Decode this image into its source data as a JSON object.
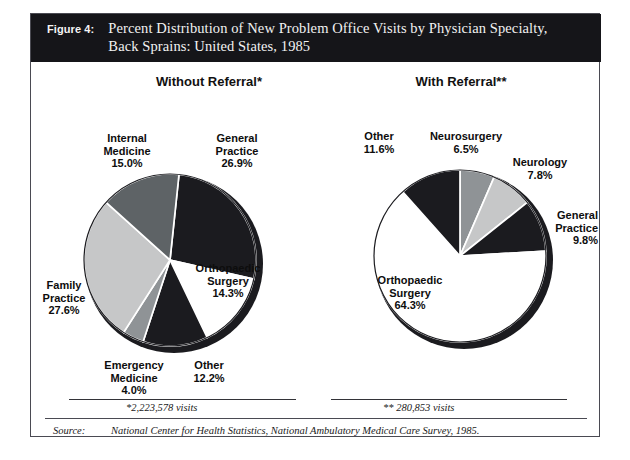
{
  "figure": {
    "label": "Figure 4:",
    "title_line_1": "Percent Distribution of New Problem Office Visits by Physician Specialty,",
    "title_line_2": "Back Sprains:  United States, 1985"
  },
  "panels": {
    "left_heading": "Without Referral*",
    "right_heading": "With Referral**"
  },
  "footnotes": {
    "left": "*2,223,578 visits",
    "right": "** 280,853 visits",
    "source_label": "Source:",
    "source_text": "National Center for Health Statistics, National Ambulatory Medical Care Survey, 1985."
  },
  "colors": {
    "header_bg": "#151519",
    "black_slice": "#1b1b1f",
    "dark_gray_slice": "#5e6366",
    "mid_gray_slice": "#8f9396",
    "light_gray_slice": "#c6c7c8",
    "white_slice": "#ffffff",
    "slice_outline": "#ffffff",
    "pie_edge": "#1b1b1f",
    "frame_border": "#4a4a52"
  },
  "chart_data": [
    {
      "type": "pie",
      "title": "Without Referral*",
      "total_label": "*2,223,578 visits",
      "total_visits": 2223578,
      "legend": "labels placed around slices",
      "categories": [
        "General Practice",
        "Orthopaedic Surgery",
        "Other",
        "Emergency Medicine",
        "Family Practice",
        "Internal Medicine"
      ],
      "values": [
        26.9,
        14.3,
        12.2,
        4.0,
        27.6,
        15.0
      ],
      "unit": "percent",
      "slices": [
        {
          "name": "General Practice",
          "percent": "26.9%",
          "value": 26.9,
          "fill": "#1b1b1f",
          "label_lines": [
            "General",
            "Practice",
            "26.9%"
          ]
        },
        {
          "name": "Orthopaedic Surgery",
          "percent": "14.3%",
          "value": 14.3,
          "fill": "#ffffff",
          "label_lines": [
            "Orthopaedic",
            "Surgery",
            "14.3%"
          ]
        },
        {
          "name": "Other",
          "percent": "12.2%",
          "value": 12.2,
          "fill": "#1b1b1f",
          "label_lines": [
            "Other",
            "12.2%"
          ]
        },
        {
          "name": "Emergency Medicine",
          "percent": "4.0%",
          "value": 4.0,
          "fill": "#8f9396",
          "label_lines": [
            "Emergency",
            "Medicine",
            "4.0%"
          ]
        },
        {
          "name": "Family Practice",
          "percent": "27.6%",
          "value": 27.6,
          "fill": "#c6c7c8",
          "label_lines": [
            "Family",
            "Practice",
            "27.6%"
          ]
        },
        {
          "name": "Internal Medicine",
          "percent": "15.0%",
          "value": 15.0,
          "fill": "#5e6366",
          "label_lines": [
            "Internal",
            "Medicine",
            "15.0%"
          ]
        }
      ]
    },
    {
      "type": "pie",
      "title": "With Referral**",
      "total_label": "** 280,853 visits",
      "total_visits": 280853,
      "legend": "labels placed around slices",
      "categories": [
        "Neurosurgery",
        "Neurology",
        "General Practice",
        "Orthopaedic Surgery",
        "Other"
      ],
      "values": [
        6.5,
        7.8,
        9.8,
        64.3,
        11.6
      ],
      "unit": "percent",
      "slices": [
        {
          "name": "Neurosurgery",
          "percent": "6.5%",
          "value": 6.5,
          "fill": "#8f9396",
          "label_lines": [
            "Neurosurgery",
            "6.5%"
          ]
        },
        {
          "name": "Neurology",
          "percent": "7.8%",
          "value": 7.8,
          "fill": "#c6c7c8",
          "label_lines": [
            "Neurology",
            "7.8%"
          ]
        },
        {
          "name": "General Practice",
          "percent": "9.8%",
          "value": 9.8,
          "fill": "#1b1b1f",
          "label_lines": [
            "General",
            "Practice",
            "9.8%"
          ]
        },
        {
          "name": "Orthopaedic Surgery",
          "percent": "64.3%",
          "value": 64.3,
          "fill": "#ffffff",
          "label_lines": [
            "Orthopaedic",
            "Surgery",
            "64.3%"
          ]
        },
        {
          "name": "Other",
          "percent": "11.6%",
          "value": 11.6,
          "fill": "#1b1b1f",
          "label_lines": [
            "Other",
            "11.6%"
          ]
        }
      ]
    }
  ]
}
